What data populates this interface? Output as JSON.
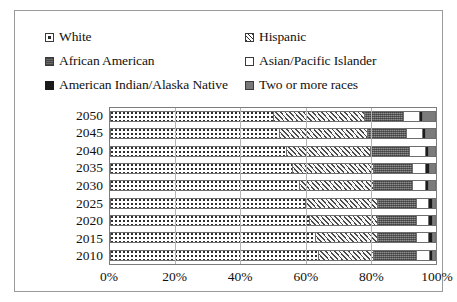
{
  "legend": {
    "items": [
      {
        "label": "White",
        "swatch": "white-dotted-swatch-icon",
        "key": "white"
      },
      {
        "label": "Hispanic",
        "swatch": "hispanic-hatch-swatch-icon",
        "key": "hispanic"
      },
      {
        "label": "African American",
        "swatch": "african-american-swatch-icon",
        "key": "african"
      },
      {
        "label": "Asian/Pacific Islander",
        "swatch": "asian-pacific-islander-swatch-icon",
        "key": "asian"
      },
      {
        "label": "American Indian/Alaska Native",
        "swatch": "american-indian-swatch-icon",
        "key": "amind"
      },
      {
        "label": "Two or more races",
        "swatch": "two-or-more-races-swatch-icon",
        "key": "two"
      }
    ]
  },
  "chart_data": {
    "type": "bar",
    "orientation": "horizontal",
    "stacked": true,
    "normalized": true,
    "title": "",
    "xlabel": "",
    "ylabel": "",
    "xlim": [
      0,
      100
    ],
    "xticks": [
      0,
      20,
      40,
      60,
      80,
      100
    ],
    "xticklabels": [
      "0%",
      "20%",
      "40%",
      "60%",
      "80%",
      "100%"
    ],
    "grid": true,
    "legend_position": "top",
    "categories": [
      "2050",
      "2045",
      "2040",
      "2035",
      "2030",
      "2025",
      "2020",
      "2015",
      "2010"
    ],
    "series": [
      {
        "name": "White",
        "pattern": "dots",
        "color": "#ffffff",
        "values": [
          50,
          52,
          54,
          56,
          58,
          60,
          61,
          63,
          64
        ]
      },
      {
        "name": "Hispanic",
        "pattern": "diagonal",
        "color": "#f4f4f4",
        "values": [
          28,
          27,
          26,
          25,
          23,
          22,
          21,
          19,
          17
        ]
      },
      {
        "name": "African American",
        "pattern": "speckle",
        "color": "#6e6e6e",
        "values": [
          12,
          12,
          12,
          12,
          12,
          12,
          12,
          12,
          13
        ]
      },
      {
        "name": "Asian/Pacific Islander",
        "pattern": "solid",
        "color": "#ffffff",
        "values": [
          5,
          5,
          5,
          4,
          4,
          4,
          4,
          4,
          4
        ]
      },
      {
        "name": "American Indian/Alaska Native",
        "pattern": "solid",
        "color": "#1c1c1c",
        "values": [
          1,
          1,
          1,
          1,
          1,
          1,
          1,
          1,
          1
        ]
      },
      {
        "name": "Two or more races",
        "pattern": "solid",
        "color": "#7b7b7b",
        "values": [
          4,
          3,
          2,
          2,
          2,
          1,
          1,
          1,
          1
        ]
      }
    ]
  }
}
